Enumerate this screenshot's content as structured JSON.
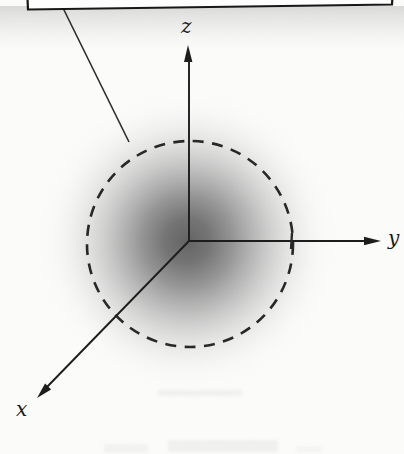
{
  "figure": {
    "kind": "electron-cloud-orbital-diagram",
    "labels": {
      "x": "x",
      "y": "y",
      "z": "z"
    }
  },
  "colors": {
    "background": "#fcfcfb",
    "line": "#1b1b1b",
    "dashed_circle": "#262626",
    "cloud_center": "#636363",
    "box_fill": "#fefefe",
    "box_border": "#151515",
    "shadow": "#787878"
  }
}
